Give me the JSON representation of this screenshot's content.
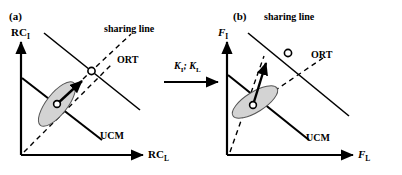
{
  "figure": {
    "type": "schematic-diagram",
    "width": 402,
    "height": 175,
    "background": "#ffffff",
    "stroke_color": "#000000",
    "ellipse_fill": "#d3d3d3"
  },
  "transition": {
    "label_k_i": "K",
    "label_k_i_sub": "I",
    "separator": "; ",
    "label_k_l": "K",
    "label_k_l_sub": "L",
    "full_label": "KI; KL",
    "arrow_icon": "right-arrow-icon"
  },
  "panels": [
    {
      "tag": "(a)",
      "y_axis": {
        "base": "RC",
        "sub": "I",
        "full": "RCI"
      },
      "x_axis": {
        "base": "RC",
        "sub": "L",
        "full": "RCL"
      },
      "labels": {
        "sharing_line": "sharing line",
        "ort": "ORT",
        "ucm": "UCM"
      },
      "elements": {
        "ucm_line": "solid-ucm-line",
        "sharing_line": "solid-sharing-line",
        "ort_line": "dashed-ort-line",
        "identity_line": "dashed-identity-line",
        "data_ellipse": "gray-variance-ellipse",
        "mean_marker": "open-circle-marker",
        "target_marker": "open-circle-marker",
        "shift_arrow": "solid-shift-arrow"
      }
    },
    {
      "tag": "(b)",
      "y_axis": {
        "base": "F",
        "sub": "I",
        "full": "FI"
      },
      "x_axis": {
        "base": "F",
        "sub": "L",
        "full": "FL"
      },
      "labels": {
        "sharing_line": "sharing line",
        "ort": "ORT",
        "ucm": "UCM"
      },
      "elements": {
        "ucm_line": "solid-ucm-line",
        "sharing_line": "solid-sharing-line",
        "ort_line": "dashed-ort-line",
        "identity_line": "dashed-identity-line",
        "data_ellipse": "gray-variance-ellipse",
        "mean_marker": "open-circle-marker",
        "target_marker": "open-circle-marker",
        "shift_arrow": "solid-shift-arrow"
      }
    }
  ]
}
